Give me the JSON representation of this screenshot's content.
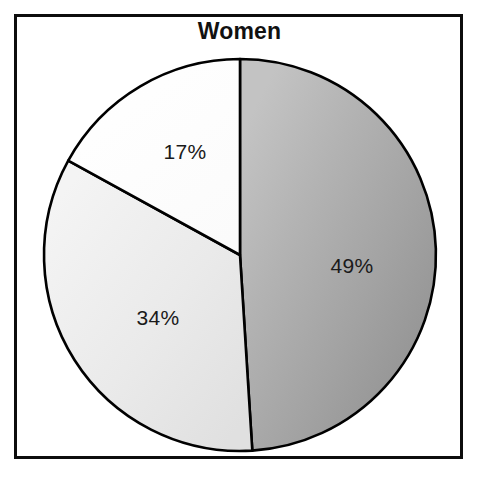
{
  "figure": {
    "title": "Women",
    "background_color": "#ffffff",
    "frame_color": "#0d0d0d"
  },
  "chart_data": {
    "type": "pie",
    "title": "Women",
    "subtitle": "",
    "xlabel": "",
    "ylabel": "",
    "grid": false,
    "legend": "none",
    "start_angle_deg_from_12oclock": 0,
    "direction": "clockwise",
    "total_percent": 100,
    "categories": [
      "49%",
      "34%",
      "17%"
    ],
    "values": [
      49,
      34,
      17
    ],
    "slices": [
      {
        "label": "49%",
        "value": 49,
        "angle_deg": 176.4,
        "fill": "#a8a8a8",
        "fill_style": "gradient-gray",
        "edge_color": "#000000",
        "label_x": 352,
        "label_y": 266
      },
      {
        "label": "34%",
        "value": 34,
        "angle_deg": 122.4,
        "fill": "#ededed",
        "fill_style": "solid-light-gray",
        "edge_color": "#000000",
        "label_x": 158,
        "label_y": 318
      },
      {
        "label": "17%",
        "value": 17,
        "angle_deg": 61.2,
        "fill": "#ffffff",
        "fill_style": "solid-white",
        "edge_color": "#000000",
        "label_x": 185,
        "label_y": 152
      }
    ],
    "geometry": {
      "center_x": 240,
      "center_y": 255,
      "radius": 196
    }
  }
}
